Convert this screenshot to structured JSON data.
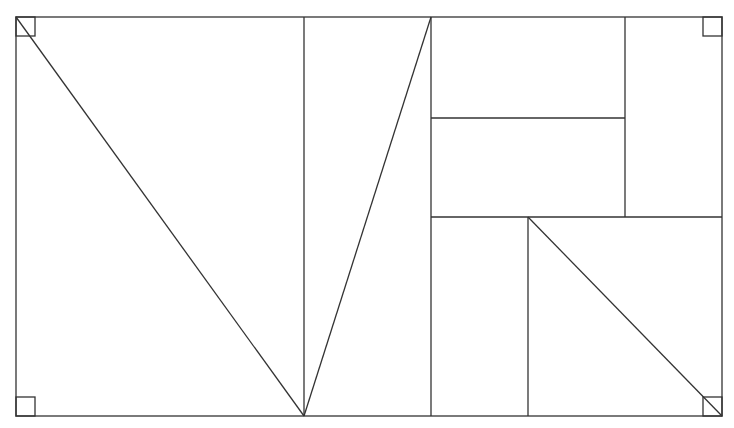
{
  "diagram": {
    "stroke_color": "#333333",
    "background": "#ffffff",
    "outer_rect": {
      "x1": 16,
      "y1": 17,
      "x2": 722,
      "y2": 416
    },
    "vertices": {
      "bottom_mid": [
        304,
        416
      ],
      "top_vertical_x": 431,
      "left_vertical_x": 304,
      "right_vertical_x": 625,
      "inner_vertical_x": 528,
      "mid_horizontal_y": 118,
      "low_horizontal_y": 217
    },
    "right_angle_markers": [
      "top-left",
      "bottom-left",
      "top-right",
      "bottom-right"
    ]
  }
}
